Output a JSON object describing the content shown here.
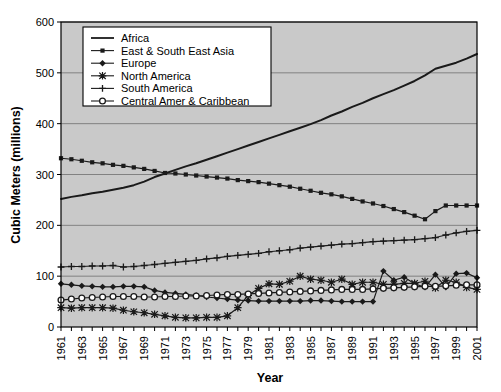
{
  "chart_data": {
    "type": "line",
    "title": "",
    "xlabel": "Year",
    "ylabel": "Cubic Meters (millions)",
    "xlim": [
      1961,
      2001
    ],
    "ylim": [
      0,
      600
    ],
    "yticks": [
      0,
      100,
      200,
      300,
      400,
      500,
      600
    ],
    "xticks": [
      1961,
      1963,
      1965,
      1967,
      1969,
      1971,
      1973,
      1975,
      1977,
      1979,
      1981,
      1983,
      1985,
      1987,
      1989,
      1991,
      1993,
      1995,
      1997,
      1999,
      2001
    ],
    "x": [
      1961,
      1962,
      1963,
      1964,
      1965,
      1966,
      1967,
      1968,
      1969,
      1970,
      1971,
      1972,
      1973,
      1974,
      1975,
      1976,
      1977,
      1978,
      1979,
      1980,
      1981,
      1982,
      1983,
      1984,
      1985,
      1986,
      1987,
      1988,
      1989,
      1990,
      1991,
      1992,
      1993,
      1994,
      1995,
      1996,
      1997,
      1998,
      1999,
      2000,
      2001
    ],
    "grid": true,
    "grid_axis": "y",
    "legend_position": "top-left",
    "plot_background": "#c9c9c9",
    "figure_background": "#ffffff",
    "line_color": "#1a1a1a",
    "series": [
      {
        "name": "Africa",
        "marker": "none",
        "values": [
          252,
          256,
          259,
          263,
          266,
          270,
          274,
          279,
          286,
          295,
          302,
          309,
          316,
          322,
          329,
          336,
          343,
          350,
          357,
          364,
          371,
          378,
          385,
          392,
          399,
          407,
          416,
          424,
          433,
          441,
          450,
          458,
          466,
          475,
          484,
          495,
          508,
          514,
          520,
          528,
          537
        ]
      },
      {
        "name": "East & South East Asia",
        "marker": "square",
        "values": [
          332,
          330,
          327,
          324,
          322,
          319,
          317,
          314,
          311,
          307,
          303,
          302,
          300,
          298,
          296,
          294,
          292,
          289,
          287,
          285,
          282,
          279,
          276,
          272,
          268,
          264,
          261,
          257,
          252,
          247,
          243,
          238,
          232,
          226,
          219,
          212,
          228,
          239,
          239,
          239,
          239
        ]
      },
      {
        "name": "Europe",
        "marker": "diamond",
        "values": [
          85,
          83,
          81,
          80,
          79,
          79,
          80,
          80,
          79,
          72,
          68,
          66,
          64,
          62,
          59,
          57,
          55,
          53,
          52,
          51,
          51,
          51,
          51,
          51,
          52,
          52,
          51,
          50,
          50,
          50,
          50,
          110,
          92,
          98,
          85,
          78,
          103,
          78,
          105,
          106,
          97
        ]
      },
      {
        "name": "North America",
        "marker": "star",
        "values": [
          38,
          37,
          38,
          38,
          38,
          37,
          33,
          30,
          28,
          25,
          22,
          19,
          18,
          18,
          19,
          19,
          22,
          38,
          62,
          76,
          85,
          84,
          90,
          100,
          94,
          92,
          88,
          94,
          84,
          88,
          88,
          84,
          84,
          86,
          86,
          90,
          77,
          92,
          88,
          78,
          74
        ]
      },
      {
        "name": "South America",
        "marker": "plus",
        "values": [
          118,
          119,
          119,
          120,
          120,
          121,
          118,
          119,
          121,
          123,
          125,
          127,
          129,
          131,
          134,
          136,
          139,
          141,
          143,
          145,
          148,
          150,
          152,
          155,
          157,
          159,
          161,
          163,
          164,
          166,
          168,
          169,
          170,
          171,
          172,
          174,
          176,
          181,
          185,
          188,
          190
        ]
      },
      {
        "name": "Central Amer & Caribbean",
        "marker": "circle-open",
        "values": [
          53,
          55,
          57,
          58,
          59,
          60,
          60,
          60,
          59,
          59,
          60,
          60,
          61,
          61,
          62,
          63,
          64,
          64,
          65,
          66,
          67,
          68,
          69,
          70,
          71,
          72,
          73,
          74,
          74,
          74,
          75,
          76,
          77,
          78,
          79,
          80,
          80,
          81,
          82,
          83,
          83
        ]
      }
    ]
  },
  "legend": {
    "entries": [
      {
        "label": "Africa",
        "marker": "none"
      },
      {
        "label": "East & South East Asia",
        "marker": "square"
      },
      {
        "label": "Europe",
        "marker": "diamond"
      },
      {
        "label": "North America",
        "marker": "star"
      },
      {
        "label": "South America",
        "marker": "plus"
      },
      {
        "label": "Central Amer & Caribbean",
        "marker": "circle-open"
      }
    ]
  }
}
